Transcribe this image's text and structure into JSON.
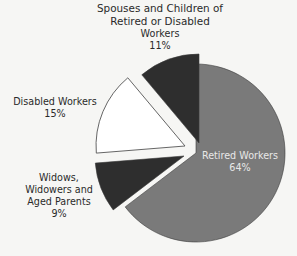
{
  "chart_data": {
    "type": "pie",
    "title": "",
    "exploded": true,
    "start_angle_deg": 0,
    "direction": "clockwise",
    "slices": [
      {
        "label": "Retired Workers",
        "value": 64,
        "value_label": "64%",
        "color": "#7a7a7a",
        "text_color": "#e8e8e8"
      },
      {
        "label": "Widows, Widowers and Aged Parents",
        "value": 9,
        "value_label": "9%",
        "color": "#2e2e2e",
        "text_color": "#2a2a2a"
      },
      {
        "label": "Disabled Workers",
        "value": 15,
        "value_label": "15%",
        "color": "#ffffff",
        "stroke": "#555555",
        "text_color": "#2a2a2a"
      },
      {
        "label": "Spouses and Children of Retired or Disabled Workers",
        "value": 11,
        "value_label": "11%",
        "color": "#2e2e2e",
        "text_color": "#2a2a2a"
      }
    ],
    "legend": null
  },
  "labels": {
    "spouses": {
      "line1": "Spouses and Children of",
      "line2": "Retired or Disabled",
      "line3": "Workers",
      "pct": "11%"
    },
    "disabled": {
      "line1": "Disabled Workers",
      "pct": "15%"
    },
    "widows": {
      "line1": "Widows,",
      "line2": "Widowers and",
      "line3": "Aged Parents",
      "pct": "9%"
    },
    "retired": {
      "line1": "Retired Workers",
      "pct": "64%"
    }
  },
  "geometry": {
    "radius": 89,
    "centers": [
      [
        196,
        153
      ],
      [
        184,
        156
      ],
      [
        185,
        146
      ],
      [
        199,
        143
      ]
    ]
  }
}
